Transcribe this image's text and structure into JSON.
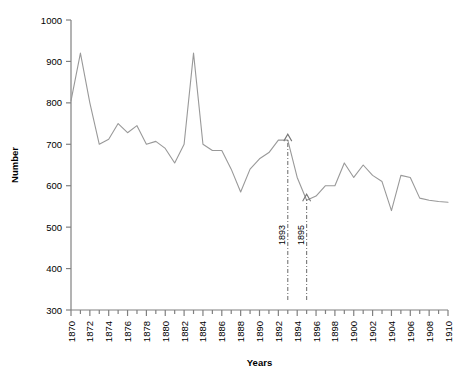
{
  "chart_data": {
    "type": "line",
    "title": "",
    "xlabel": "Years",
    "ylabel": "Number",
    "xlim": [
      1870,
      1910
    ],
    "ylim": [
      300,
      1000
    ],
    "grid": false,
    "legend": null,
    "line_color": "#999999",
    "axis_color": "#808080",
    "text_color": "#000000",
    "ytick_labels": [
      "300",
      "400",
      "500",
      "600",
      "700",
      "800",
      "900",
      "1000"
    ],
    "ytick_values": [
      300,
      400,
      500,
      600,
      700,
      800,
      900,
      1000
    ],
    "xtick_labels": [
      "1870",
      "1872",
      "1874",
      "1876",
      "1878",
      "1880",
      "1882",
      "1884",
      "1886",
      "1888",
      "1890",
      "1892",
      "1894",
      "1896",
      "1898",
      "1900",
      "1902",
      "1904",
      "1906",
      "1908",
      "1910"
    ],
    "xtick_values": [
      1870,
      1872,
      1874,
      1876,
      1878,
      1880,
      1882,
      1884,
      1886,
      1888,
      1890,
      1892,
      1894,
      1896,
      1898,
      1900,
      1902,
      1904,
      1906,
      1908,
      1910
    ],
    "x": [
      1870,
      1871,
      1872,
      1873,
      1874,
      1875,
      1876,
      1877,
      1878,
      1879,
      1880,
      1881,
      1882,
      1883,
      1884,
      1885,
      1886,
      1887,
      1888,
      1889,
      1890,
      1891,
      1892,
      1893,
      1894,
      1895,
      1896,
      1897,
      1898,
      1899,
      1900,
      1901,
      1902,
      1903,
      1904,
      1905,
      1906,
      1907,
      1908,
      1909,
      1910
    ],
    "values": [
      805,
      920,
      800,
      700,
      712,
      750,
      728,
      745,
      700,
      707,
      690,
      655,
      700,
      920,
      700,
      685,
      685,
      640,
      585,
      640,
      665,
      680,
      710,
      710,
      620,
      565,
      575,
      600,
      600,
      655,
      620,
      650,
      625,
      610,
      540,
      625,
      620,
      570,
      565,
      562,
      560
    ],
    "annotations": [
      {
        "label": "1893",
        "x": 1893,
        "target_value": 710,
        "style": "dash-dot-arrow"
      },
      {
        "label": "1895",
        "x": 1895,
        "target_value": 565,
        "style": "dash-dot-arrow"
      }
    ]
  }
}
